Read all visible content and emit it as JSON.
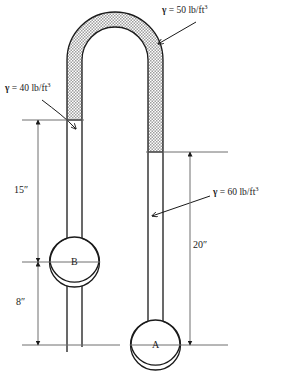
{
  "figure": {
    "background_color": "#ffffff",
    "line_color": "#1a1a1a",
    "fill_color": "#cfcfcf"
  },
  "annotations": {
    "gamma_top": {
      "name": "gamma-50-label",
      "symbol": "γ",
      "equals": " = 50 lb/ft",
      "exponent": "3",
      "value": 50,
      "units": "lb/ft^3"
    },
    "gamma_left": {
      "name": "gamma-40-label",
      "symbol": "γ",
      "equals": " = 40 lb/ft",
      "exponent": "3",
      "value": 40,
      "units": "lb/ft^3"
    },
    "gamma_right": {
      "name": "gamma-60-label",
      "symbol": "γ",
      "equals": " = 60 lb/ft",
      "exponent": "3",
      "value": 60,
      "units": "lb/ft^3"
    }
  },
  "dimensions": {
    "left_upper": {
      "label": "15″",
      "value": 15,
      "units": "in"
    },
    "left_lower": {
      "label": "8″",
      "value": 8,
      "units": "in"
    },
    "right": {
      "label": "20″",
      "value": 20,
      "units": "in"
    }
  },
  "vessels": {
    "b": {
      "label": "B"
    },
    "a": {
      "label": "A"
    }
  }
}
